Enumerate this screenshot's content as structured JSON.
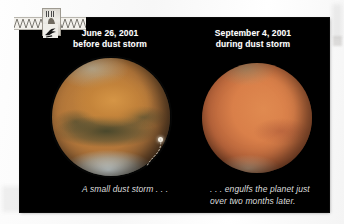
{
  "figure": {
    "kind": "two-panel before-and-after photo comparison of Mars",
    "background_color": "#000000",
    "page_background_color": "#ffffff"
  },
  "panels": {
    "left": {
      "date": "June 26, 2001",
      "condition": "before dust storm",
      "subject": "Mars",
      "annotation": "A small dust storm . . .",
      "marker_label": "small-dust-storm-marker"
    },
    "right": {
      "date": "September 4, 2001",
      "condition": "during dust storm",
      "subject": "Mars",
      "annotation_line_1": ". . . engulfs the planet just",
      "annotation_line_2": "over two months later."
    }
  },
  "colors": {
    "panel_background": "#000000",
    "caption_text": "#ffffff",
    "annotation_text": "#dcdcdc",
    "mars_before": "#b2763a",
    "mars_during": "#d97f49",
    "polar_cap": "#dfeef0",
    "leader_line": "#cfc9bd"
  },
  "artifact": {
    "name": "scan-edge-artifact",
    "description": "torn paper strip with zigzag edge and a small thumbnail image"
  }
}
